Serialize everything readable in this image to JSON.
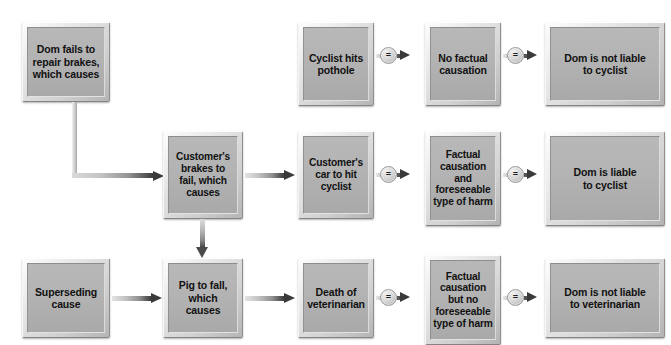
{
  "diagram": {
    "type": "flowchart",
    "colors": {
      "node_fill": "#b3b3b3",
      "node_bevel_light": "#fdfdfd",
      "node_bevel_dark": "#848484",
      "arrow_dark": "#3a3a3a",
      "background": "#ffffff",
      "text": "#111111"
    },
    "nodes": [
      {
        "id": "dom-fails",
        "label": "Dom fails to\nrepair brakes,\nwhich causes"
      },
      {
        "id": "cyclist-pothole",
        "label": "Cyclist hits\npothole"
      },
      {
        "id": "no-factual-causation",
        "label": "No factual\ncausation"
      },
      {
        "id": "not-liable-cyclist",
        "label": "Dom is not liable\nto cyclist"
      },
      {
        "id": "customer-brakes",
        "label": "Customer's\nbrakes to\nfail, which\ncauses"
      },
      {
        "id": "customer-car",
        "label": "Customer's\ncar to hit\ncyclist"
      },
      {
        "id": "factual-foreseeable",
        "label": "Factual\ncausation\nand\nforeseeable\ntype of harm"
      },
      {
        "id": "liable-cyclist",
        "label": "Dom is liable\nto cyclist"
      },
      {
        "id": "superseding-cause",
        "label": "Superseding\ncause"
      },
      {
        "id": "pig-to-fall",
        "label": "Pig to fall,\nwhich causes"
      },
      {
        "id": "death-vet",
        "label": "Death of\nveterinarian"
      },
      {
        "id": "factual-no-foresee",
        "label": "Factual\ncausation\nbut no\nforeseeable\ntype of harm"
      },
      {
        "id": "not-liable-vet",
        "label": "Dom is not liable\nto veterinarian"
      }
    ],
    "connectors": {
      "equals_symbol": "=",
      "equals_links": [
        {
          "from": "cyclist-pothole",
          "to": "no-factual-causation"
        },
        {
          "from": "no-factual-causation",
          "to": "not-liable-cyclist"
        },
        {
          "from": "customer-car",
          "to": "factual-foreseeable"
        },
        {
          "from": "factual-foreseeable",
          "to": "liable-cyclist"
        },
        {
          "from": "death-vet",
          "to": "factual-no-foresee"
        },
        {
          "from": "factual-no-foresee",
          "to": "not-liable-vet"
        }
      ],
      "arrow_links": [
        {
          "from": "dom-fails",
          "to": "customer-brakes",
          "style": "elbow-down-right"
        },
        {
          "from": "customer-brakes",
          "to": "customer-car",
          "style": "horizontal"
        },
        {
          "from": "customer-brakes",
          "to": "pig-to-fall",
          "style": "vertical"
        },
        {
          "from": "superseding-cause",
          "to": "pig-to-fall",
          "style": "horizontal"
        },
        {
          "from": "pig-to-fall",
          "to": "death-vet",
          "style": "horizontal"
        }
      ]
    }
  }
}
